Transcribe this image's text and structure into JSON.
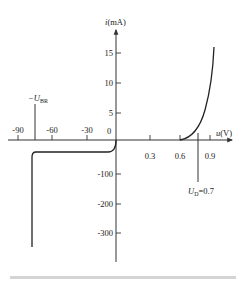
{
  "diagram": {
    "y_axis": {
      "label_italic": "i",
      "label_unit": "(mA)",
      "positive_ticks": [
        "15",
        "10",
        "5"
      ],
      "origin_label": "0",
      "negative_ticks": [
        "-100",
        "-200",
        "-300"
      ]
    },
    "x_axis": {
      "label_italic": "u",
      "label_unit": "(V)",
      "negative_ticks": [
        "-90",
        "-60",
        "-30"
      ],
      "positive_ticks": [
        "0.3",
        "0.6",
        "0.9"
      ]
    },
    "annotations": {
      "breakdown_prefix": "−U",
      "breakdown_sub": "BR",
      "threshold_prefix": "U",
      "threshold_sub": "D",
      "threshold_value": "=0.7"
    },
    "colors": {
      "line": "#222222",
      "footer": "#d4d4d4"
    }
  }
}
